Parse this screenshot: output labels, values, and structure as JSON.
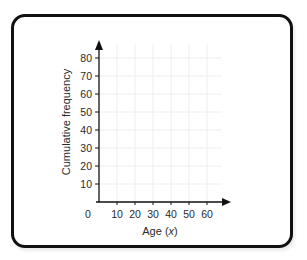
{
  "chart_data": {
    "type": "line",
    "title": "",
    "xlabel": "Age (x)",
    "xlabel_prefix": "Age (",
    "xlabel_var": "x",
    "xlabel_suffix": ")",
    "ylabel": "Cumulative frequency",
    "origin_label": "0",
    "x_ticks": [
      "10",
      "20",
      "30",
      "40",
      "50",
      "60"
    ],
    "y_ticks": [
      "10",
      "20",
      "30",
      "40",
      "50",
      "60",
      "70",
      "80"
    ],
    "xlim": [
      0,
      70
    ],
    "ylim": [
      0,
      90
    ],
    "grid": true,
    "series": [],
    "legend": null
  },
  "colors": {
    "axis": "#111111",
    "grid": "#eeeeee",
    "frame": "#111111",
    "text": "#2a2a2a"
  }
}
